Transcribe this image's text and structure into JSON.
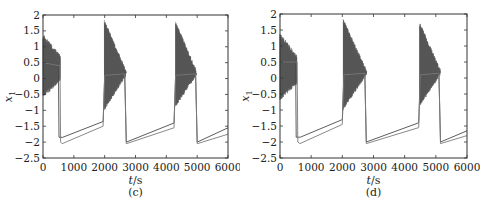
{
  "chart_data": [
    {
      "type": "line",
      "panel_label": "(c)",
      "xlabel": "t/s",
      "ylabel": "x1",
      "xlim": [
        0,
        6000
      ],
      "ylim": [
        -2.5,
        2
      ],
      "xticks": [
        0,
        1000,
        2000,
        3000,
        4000,
        5000,
        6000
      ],
      "xtick_labels": [
        "0",
        "1000",
        "2000",
        "3000",
        "4000",
        "5000",
        "6000"
      ],
      "yticks": [
        2,
        1.5,
        1,
        0.5,
        0,
        -0.5,
        -1,
        -1.5,
        -2,
        -2.5
      ],
      "ytick_labels": [
        "2",
        "1.5",
        "1",
        "0.5",
        "0",
        "−0.5",
        "−1",
        "−1.5",
        "−2",
        "−2.5"
      ],
      "grid": false,
      "legend": null,
      "description": "Relaxation oscillation: dense high-frequency bursts (x1 roughly 0 to 1.8) followed by sharp drops to about -2 and slow linear ramps upward; two traces nearly overlapping",
      "bursts": [
        {
          "t_start": 0,
          "t_end": 560,
          "max": 1.4,
          "min": -0.6
        },
        {
          "t_start": 1990,
          "t_end": 2700,
          "max": 1.85,
          "min": -1.0
        },
        {
          "t_start": 4300,
          "t_end": 4980,
          "max": 1.8,
          "min": -0.9
        }
      ],
      "series": [
        {
          "name": "trace 1",
          "x": [
            0,
            500,
            520,
            640,
            1950,
            2000,
            2650,
            2700,
            4250,
            4300,
            4950,
            5000,
            6000
          ],
          "y": [
            0.5,
            0.4,
            -1.85,
            -1.85,
            -1.35,
            0.1,
            0.15,
            -2.0,
            -1.4,
            0.1,
            0.15,
            -2.0,
            -1.55
          ]
        },
        {
          "name": "trace 2",
          "x": [
            0,
            550,
            570,
            620,
            1950,
            2000,
            2650,
            2700,
            4250,
            4300,
            4950,
            5000,
            6000
          ],
          "y": [
            0.5,
            0.4,
            -2.0,
            -2.05,
            -1.5,
            0.1,
            0.15,
            -2.05,
            -1.55,
            0.1,
            0.15,
            -2.05,
            -1.75
          ]
        }
      ]
    },
    {
      "type": "line",
      "panel_label": "(d)",
      "xlabel": "t/s",
      "ylabel": "x1",
      "xlim": [
        0,
        6000
      ],
      "ylim": [
        -2.5,
        2
      ],
      "xticks": [
        0,
        1000,
        2000,
        3000,
        4000,
        5000,
        6000
      ],
      "xtick_labels": [
        "0",
        "1000",
        "2000",
        "3000",
        "4000",
        "5000",
        "6000"
      ],
      "yticks": [
        2,
        1.5,
        1,
        0.5,
        0,
        -0.5,
        -1,
        -1.5,
        -2,
        -2.5
      ],
      "ytick_labels": [
        "2",
        "1.5",
        "1",
        "0.5",
        "0",
        "−0.5",
        "−1",
        "−1.5",
        "−2",
        "−2.5"
      ],
      "grid": false,
      "legend": null,
      "description": "Same system as (c) with slightly shifted timing: bursts near t=0-550, 2050-2780, 4500-5150",
      "bursts": [
        {
          "t_start": 0,
          "t_end": 540,
          "max": 1.4,
          "min": -0.7
        },
        {
          "t_start": 2030,
          "t_end": 2780,
          "max": 1.85,
          "min": -1.0
        },
        {
          "t_start": 4480,
          "t_end": 5150,
          "max": 1.75,
          "min": -0.9
        }
      ],
      "series": [
        {
          "name": "trace 1",
          "x": [
            0,
            500,
            520,
            650,
            2000,
            2050,
            2720,
            2770,
            4450,
            4500,
            5100,
            5150,
            6000
          ],
          "y": [
            0.5,
            0.5,
            -1.85,
            -1.85,
            -1.3,
            0.1,
            0.15,
            -2.0,
            -1.4,
            0.1,
            0.15,
            -2.0,
            -1.65
          ]
        },
        {
          "name": "trace 2",
          "x": [
            0,
            550,
            570,
            640,
            2000,
            2050,
            2720,
            2770,
            4450,
            4500,
            5100,
            5150,
            6000
          ],
          "y": [
            0.5,
            0.5,
            -2.0,
            -2.05,
            -1.45,
            0.1,
            0.15,
            -2.05,
            -1.55,
            0.1,
            0.15,
            -2.05,
            -1.8
          ]
        }
      ]
    }
  ],
  "panels": {
    "c": {
      "caption": "(c)",
      "xlabel_t": "t",
      "xlabel_unit": "/s",
      "ylabel_base": "x",
      "ylabel_sub": "1"
    },
    "d": {
      "caption": "(d)",
      "xlabel_t": "t",
      "xlabel_unit": "/s",
      "ylabel_base": "x",
      "ylabel_sub": "1"
    }
  },
  "colors": {
    "axis": "#333333",
    "trace1": "#4a4a4a",
    "trace2": "#7a7a7a",
    "burst": "#555555"
  }
}
